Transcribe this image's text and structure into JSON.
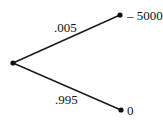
{
  "tree": {
    "root": {
      "x": 13,
      "y": 63
    },
    "branches": [
      {
        "probability": ".005",
        "outcome": "– 5000",
        "end": {
          "x": 120,
          "y": 15
        }
      },
      {
        "probability": ".995",
        "outcome": "0",
        "end": {
          "x": 121,
          "y": 110
        }
      }
    ],
    "line_color": "#1a1a1a"
  }
}
